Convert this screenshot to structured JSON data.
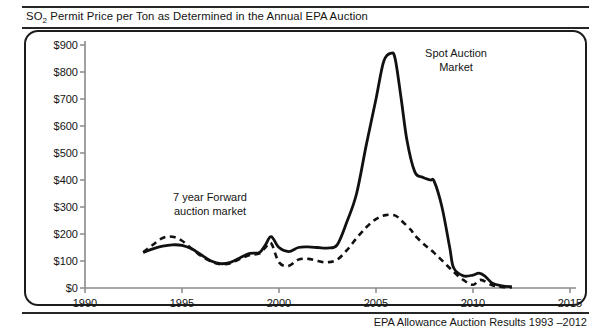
{
  "header": {
    "title_prefix": "SO",
    "title_sub": "2",
    "title_rest": " Permit Price per Ton as Determined in the Annual EPA Auction"
  },
  "footer": {
    "source_note": "EPA Allowance Auction Results 1993 –2012"
  },
  "annotations": {
    "spot": "Spot Auction\nMarket",
    "forward": "7 year Forward\nauction market"
  },
  "axes": {
    "y_ticks": [
      "$0",
      "$100",
      "$200",
      "$300",
      "$400",
      "$500",
      "$600",
      "$700",
      "$800",
      "$900"
    ],
    "x_ticks": [
      "1990",
      "1995",
      "2000",
      "2005",
      "2010",
      "2015"
    ]
  },
  "chart_data": {
    "type": "line",
    "title": "SO2 Permit Price per Ton as Determined in the Annual EPA Auction",
    "xlabel": "",
    "ylabel": "",
    "xlim": [
      1990,
      2015
    ],
    "ylim": [
      0,
      900
    ],
    "grid": false,
    "legend": "annotations-on-plot",
    "x_tick_values": [
      1990,
      1995,
      2000,
      2005,
      2010,
      2015
    ],
    "y_tick_values": [
      0,
      100,
      200,
      300,
      400,
      500,
      600,
      700,
      800,
      900
    ],
    "series": [
      {
        "name": "Spot Auction Market",
        "style": "solid",
        "color": "#111111",
        "x": [
          1993,
          1993.5,
          1994,
          1994.5,
          1995,
          1995.5,
          1996,
          1996.5,
          1997,
          1997.5,
          1998,
          1998.5,
          1999,
          1999.3,
          1999.6,
          2000,
          2000.5,
          2001,
          2001.5,
          2002,
          2002.5,
          2003,
          2003.5,
          2004,
          2004.5,
          2005,
          2005.4,
          2005.8,
          2006,
          2006.3,
          2006.6,
          2007,
          2007.4,
          2007.8,
          2008,
          2008.4,
          2008.8,
          2009,
          2009.5,
          2010,
          2010.3,
          2010.6,
          2011,
          2011.5,
          2012
        ],
        "values": [
          132,
          145,
          155,
          160,
          158,
          145,
          122,
          100,
          90,
          95,
          112,
          128,
          132,
          160,
          190,
          150,
          135,
          150,
          152,
          150,
          148,
          160,
          245,
          350,
          530,
          700,
          840,
          870,
          845,
          700,
          545,
          430,
          410,
          400,
          395,
          300,
          150,
          75,
          45,
          48,
          55,
          45,
          18,
          8,
          5
        ]
      },
      {
        "name": "7 year Forward auction market",
        "style": "dashed",
        "color": "#111111",
        "x": [
          1993,
          1993.5,
          1994,
          1994.5,
          1995,
          1995.5,
          1996,
          1996.5,
          1997,
          1997.5,
          1998,
          1998.5,
          1999,
          1999.3,
          1999.6,
          2000,
          2000.5,
          2001,
          2001.5,
          2002,
          2002.5,
          2003,
          2003.5,
          2004,
          2004.5,
          2005,
          2005.5,
          2006,
          2006.3,
          2006.8,
          2007,
          2007.5,
          2008,
          2008.5,
          2009,
          2009.5,
          2010,
          2010.4,
          2011,
          2011.5,
          2012
        ],
        "values": [
          132,
          160,
          185,
          190,
          175,
          145,
          118,
          98,
          88,
          92,
          108,
          122,
          128,
          150,
          165,
          95,
          82,
          105,
          108,
          100,
          95,
          105,
          140,
          185,
          225,
          255,
          270,
          268,
          250,
          215,
          195,
          160,
          130,
          95,
          60,
          30,
          12,
          30,
          10,
          4,
          2
        ]
      }
    ]
  }
}
